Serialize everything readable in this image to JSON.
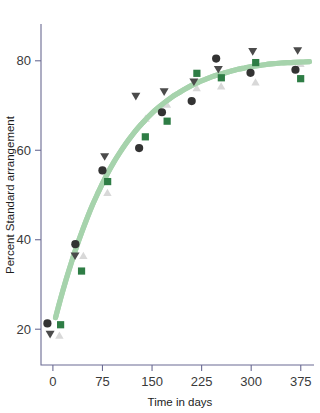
{
  "chart_data": {
    "type": "scatter",
    "title": "",
    "xlabel": "Time in days",
    "ylabel": "Percent Standard arrangement",
    "xlim": [
      -18,
      392
    ],
    "ylim": [
      12,
      88
    ],
    "xticks": [
      0,
      75,
      150,
      225,
      300,
      375
    ],
    "xtick_labels": [
      "0",
      "75",
      "150",
      "225",
      "300",
      "375"
    ],
    "yticks": [
      20,
      40,
      60,
      80
    ],
    "ytick_labels": [
      "20",
      "40",
      "60",
      "80"
    ],
    "grid": false,
    "legend": "none",
    "x": [
      0,
      37,
      78,
      135,
      168,
      213,
      250,
      302,
      370
    ],
    "series": [
      {
        "name": "dark-circle",
        "marker": "circle",
        "color": "#333333",
        "values": [
          21.3,
          39.0,
          55.5,
          60.5,
          68.5,
          71.0,
          80.5,
          77.3,
          78.0
        ]
      },
      {
        "name": "green-square",
        "marker": "square",
        "color": "#2e7d45",
        "values": [
          21.0,
          33.0,
          53.0,
          63.0,
          66.5,
          77.2,
          76.2,
          79.6,
          76.0
        ]
      },
      {
        "name": "dark-triangle-down",
        "marker": "triangle-down",
        "color": "#4b4b4b",
        "values": [
          18.8,
          36.3,
          58.5,
          72.0,
          73.0,
          75.2,
          78.0,
          82.0,
          82.2
        ]
      },
      {
        "name": "light-triangle-up",
        "marker": "triangle-up",
        "color": "#d8d8d8",
        "values": [
          18.7,
          36.5,
          50.6,
          67.2,
          70.3,
          74.0,
          74.4,
          75.3,
          79.4
        ]
      }
    ],
    "fit_curve": {
      "name": "logistic-fit",
      "color": "#a6d3ac",
      "width": 5.2,
      "points": [
        [
          4,
          22.6
        ],
        [
          12,
          27.0
        ],
        [
          20,
          31.1
        ],
        [
          28,
          34.9
        ],
        [
          36,
          38.5
        ],
        [
          44,
          41.8
        ],
        [
          52,
          44.9
        ],
        [
          60,
          47.8
        ],
        [
          68,
          50.4
        ],
        [
          76,
          52.9
        ],
        [
          84,
          55.2
        ],
        [
          92,
          57.3
        ],
        [
          100,
          59.2
        ],
        [
          110,
          61.4
        ],
        [
          120,
          63.4
        ],
        [
          130,
          65.2
        ],
        [
          140,
          66.8
        ],
        [
          150,
          68.3
        ],
        [
          160,
          69.6
        ],
        [
          170,
          70.8
        ],
        [
          180,
          71.9
        ],
        [
          190,
          72.8
        ],
        [
          200,
          73.7
        ],
        [
          210,
          74.5
        ],
        [
          220,
          75.2
        ],
        [
          230,
          75.8
        ],
        [
          240,
          76.4
        ],
        [
          250,
          76.9
        ],
        [
          260,
          77.3
        ],
        [
          270,
          77.7
        ],
        [
          280,
          78.1
        ],
        [
          290,
          78.4
        ],
        [
          300,
          78.7
        ],
        [
          315,
          79.0
        ],
        [
          330,
          79.3
        ],
        [
          345,
          79.5
        ],
        [
          360,
          79.6
        ],
        [
          375,
          79.7
        ],
        [
          388,
          79.8
        ]
      ]
    }
  },
  "axes": {
    "y_title": "Percent Standard arrangement",
    "x_title": "Time in days"
  }
}
